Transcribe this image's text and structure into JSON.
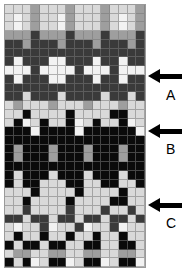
{
  "figure": {
    "type": "pattern-grid-diagram",
    "background_color": "#ffffff"
  },
  "grid": {
    "columns": 16,
    "rows": 30,
    "x": 4,
    "y": 4,
    "width": 142,
    "height": 264,
    "gridline_color": "#787878",
    "border_color": "#9a9a9a",
    "palette": {
      "w": "#f2f2f2",
      "l": "#d9d9d9",
      "m": "#9e9e9e",
      "d": "#3a3a3a",
      "k": "#0a0a0a"
    },
    "palette_names": {
      "w": "white",
      "l": "light-gray",
      "m": "medium-gray",
      "d": "dark-gray",
      "k": "black"
    },
    "rows_data": [
      "lllmlllmlllmlllm",
      "lwlmllwmlllmlwlm",
      "lwlmllwmlllmlwlm",
      "mmmdmmmdmmmdmmmd",
      "ddmdddmdddmdddmd",
      "dddddddddddddddd",
      "dwdddwwdddwddwdd",
      "wwwdwwwwdwwwdwww",
      "dwdddwwdddwddwdd",
      "dddddddddddddddd",
      "ddldddlddddlddld",
      "lmlllmlllmlllmll",
      "llkllllkllllkkll",
      "lkwlkllkwlkllkwl",
      "kkkwkkkkwkkkkkkw",
      "kkkkkkkkkkkkkkkk",
      "kmkkkmkkkmkkkmkk",
      "kmkkkmkkkmkkkmkk",
      "kkkkkkkkkkkkkkkk",
      "klkkklkkklkkklkk",
      "klkklllkkllkkllk",
      "lllkllllkllllkll",
      "llkllllkllllkkll",
      "lldlllldllldlldl",
      "ddlddlddlddlddld",
      "lwlldwlldwlldwll",
      "lkllkllkllkllkll",
      "klkklkkllkkllkkl",
      "lmmllmmllmmllmml",
      "klkwlkkwlkkwlkkw"
    ]
  },
  "annotations": [
    {
      "id": "arrow-a",
      "label": "A",
      "arrow_x": 148,
      "arrow_y": 69,
      "label_x": 166,
      "label_y": 88,
      "color": "#000000"
    },
    {
      "id": "arrow-b",
      "label": "B",
      "arrow_x": 148,
      "arrow_y": 124,
      "label_x": 166,
      "label_y": 142,
      "color": "#000000"
    },
    {
      "id": "arrow-c",
      "label": "C",
      "arrow_x": 148,
      "arrow_y": 198,
      "label_x": 166,
      "label_y": 216,
      "color": "#000000"
    }
  ]
}
